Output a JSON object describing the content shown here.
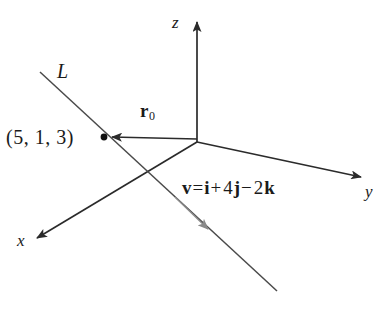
{
  "figure": {
    "name": "3D coordinate system with line L",
    "background_color": "#ffffff",
    "stroke_color": "#2b2b2b",
    "accent_color": "#8a8a8a"
  },
  "axes": {
    "z_label": "z",
    "y_label": "y",
    "x_label": "x",
    "origin": {
      "x": 197,
      "y": 142
    }
  },
  "line": {
    "label": "L",
    "start": {
      "x": 40,
      "y": 72
    },
    "end": {
      "x": 277,
      "y": 291
    }
  },
  "point": {
    "label": "(5, 1, 3)",
    "coordinates": [
      5,
      1,
      3
    ],
    "marker": {
      "x": 104,
      "y": 137
    }
  },
  "position_vector": {
    "symbol": "r",
    "subscript": "0",
    "from": {
      "x": 197,
      "y": 142
    },
    "to": {
      "x": 110,
      "y": 137
    }
  },
  "direction_vector": {
    "lhs": "v",
    "equals": "=",
    "i_term": "i",
    "plus": "+",
    "j_coeff": "4",
    "j_term": "j",
    "minus": "−",
    "k_coeff": "2",
    "k_term": "k",
    "full_text": "v = i + 4j − 2k",
    "components": [
      1,
      4,
      -2
    ],
    "arrow_at": {
      "x": 207,
      "y": 228
    }
  }
}
